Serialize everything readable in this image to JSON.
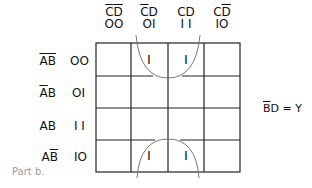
{
  "kmap": {
    "columns": [
      {
        "var_a": "C",
        "var_a_bar": true,
        "var_b": "D",
        "var_b_bar": true,
        "code": "OO"
      },
      {
        "var_a": "C",
        "var_a_bar": true,
        "var_b": "D",
        "var_b_bar": false,
        "code": "OI"
      },
      {
        "var_a": "C",
        "var_a_bar": false,
        "var_b": "D",
        "var_b_bar": false,
        "code": "I I"
      },
      {
        "var_a": "C",
        "var_a_bar": false,
        "var_b": "D",
        "var_b_bar": true,
        "code": "IO"
      }
    ],
    "rows": [
      {
        "var_a": "A",
        "var_a_bar": true,
        "var_b": "B",
        "var_b_bar": true,
        "code": "OO"
      },
      {
        "var_a": "A",
        "var_a_bar": true,
        "var_b": "B",
        "var_b_bar": false,
        "code": "OI"
      },
      {
        "var_a": "A",
        "var_a_bar": false,
        "var_b": "B",
        "var_b_bar": false,
        "code": "I I"
      },
      {
        "var_a": "A",
        "var_a_bar": false,
        "var_b": "B",
        "var_b_bar": true,
        "code": "IO"
      }
    ],
    "cells": [
      [
        "",
        "I",
        "I",
        ""
      ],
      [
        "",
        "",
        "",
        ""
      ],
      [
        "",
        "",
        "",
        ""
      ],
      [
        "",
        "I",
        "I",
        ""
      ]
    ],
    "grouping": "wrap-around group of cells (row 00 & row 10, columns 01 & 11)",
    "line_color": "#222222",
    "loop_color": "#777777"
  },
  "equation": {
    "lhs_a": "B",
    "lhs_a_bar": true,
    "lhs_b": "D",
    "rest": " = Y"
  },
  "caption": "Part b."
}
